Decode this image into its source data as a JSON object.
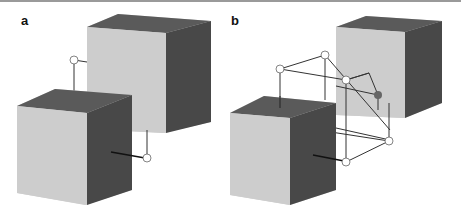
{
  "panels": [
    {
      "label": "a"
    },
    {
      "label": "b"
    }
  ],
  "colors": {
    "face_light": "#cdcdcd",
    "face_top": "#5c5c5c",
    "face_side": "#4a4a4a",
    "line": "#333333",
    "node": "#ffffff",
    "node_dark": "#555555"
  }
}
